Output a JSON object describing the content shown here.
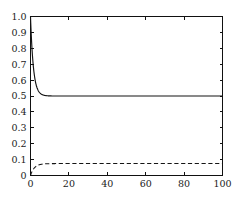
{
  "chart_data": {
    "type": "line",
    "title": "",
    "subtitle": "",
    "xlabel": "",
    "ylabel": "",
    "xlim": [
      0,
      100
    ],
    "ylim": [
      0,
      1.0
    ],
    "grid": false,
    "legend": false,
    "legend_position": "none",
    "background_color": "#ffffff",
    "axis_color": "#111111",
    "x_ticks": [
      0,
      20,
      40,
      60,
      80,
      100
    ],
    "x_tick_labels": [
      "0",
      "20",
      "40",
      "60",
      "80",
      "100"
    ],
    "y_ticks": [
      0,
      0.1,
      0.2,
      0.3,
      0.4,
      0.5,
      0.6,
      0.7,
      0.8,
      0.9,
      1.0
    ],
    "y_tick_labels": [
      "0",
      "0.1",
      "0.2",
      "0.3",
      "0.4",
      "0.5",
      "0.6",
      "0.7",
      "0.8",
      "0.9",
      "1.0"
    ],
    "series": [
      {
        "name": "solid-curve",
        "style": "solid",
        "color": "#151515",
        "initial_value": 1.0,
        "steady_state": 0.5,
        "decay_constant": 1.5,
        "x": [
          0,
          0.25,
          0.5,
          0.75,
          1,
          1.25,
          1.5,
          1.75,
          2,
          2.5,
          3,
          3.5,
          4,
          4.5,
          5,
          6,
          7,
          8,
          9,
          10,
          12,
          14,
          16,
          18,
          20,
          25,
          30,
          35,
          40,
          45,
          50,
          55,
          60,
          65,
          70,
          75,
          80,
          85,
          90,
          95,
          100
        ],
        "values": [
          1.0,
          0.923,
          0.858,
          0.802,
          0.757,
          0.718,
          0.684,
          0.656,
          0.632,
          0.594,
          0.568,
          0.55,
          0.537,
          0.528,
          0.521,
          0.513,
          0.508,
          0.505,
          0.503,
          0.502,
          0.5009,
          0.5005,
          0.5002,
          0.5001,
          0.5,
          0.5,
          0.5,
          0.5,
          0.5,
          0.5,
          0.5,
          0.5,
          0.5,
          0.5,
          0.5,
          0.5,
          0.5,
          0.5,
          0.5,
          0.5,
          0.5
        ]
      },
      {
        "name": "dashed-curve",
        "style": "dashed",
        "color": "#151515",
        "initial_value": 0.0,
        "steady_state": 0.075,
        "rise_constant": 2.0,
        "x": [
          0,
          0.5,
          1,
          1.5,
          2,
          2.5,
          3,
          3.5,
          4,
          5,
          6,
          7,
          8,
          9,
          10,
          12,
          14,
          16,
          18,
          20,
          25,
          30,
          35,
          40,
          45,
          50,
          55,
          60,
          65,
          70,
          75,
          80,
          85,
          90,
          95,
          100
        ],
        "values": [
          0.0,
          0.0166,
          0.0295,
          0.0396,
          0.0474,
          0.0535,
          0.0583,
          0.062,
          0.065,
          0.0689,
          0.0713,
          0.0728,
          0.0736,
          0.0742,
          0.0745,
          0.0748,
          0.0749,
          0.075,
          0.075,
          0.075,
          0.075,
          0.075,
          0.075,
          0.075,
          0.075,
          0.075,
          0.075,
          0.075,
          0.075,
          0.075,
          0.075,
          0.075,
          0.075,
          0.075,
          0.075,
          0.075
        ]
      }
    ]
  }
}
